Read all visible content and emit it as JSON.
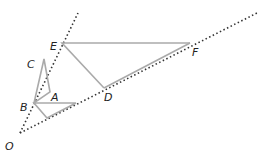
{
  "diagram": {
    "title": "",
    "colors": {
      "line": "#aaaaaa",
      "dotted": "#333333",
      "label": "#222222"
    },
    "points": {
      "O": {
        "label": "O",
        "x": 20,
        "y": 133
      },
      "B": {
        "label": "B",
        "x": 34,
        "y": 103
      },
      "A": {
        "label": "A",
        "x": 50,
        "y": 93
      },
      "C": {
        "label": "C",
        "x": 44,
        "y": 59
      },
      "E": {
        "label": "E",
        "x": 62,
        "y": 43
      },
      "D": {
        "label": "D",
        "x": 104,
        "y": 88
      },
      "F": {
        "label": "F",
        "x": 190,
        "y": 43
      }
    },
    "labels": {
      "O": "O",
      "B": "B",
      "A": "A",
      "C": "C",
      "E": "E",
      "D": "D",
      "F": "F"
    }
  }
}
